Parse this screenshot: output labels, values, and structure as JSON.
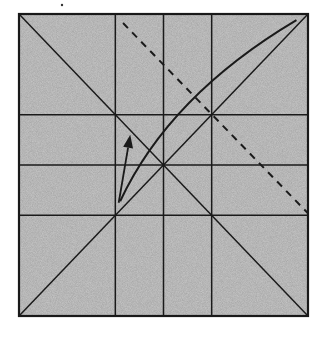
{
  "diagram": {
    "kind": "origami-crease-pattern",
    "paper_color": "#c8c8c8",
    "line_color": "#1a1a1a",
    "grid_divisions": 6,
    "crease_lines": [
      {
        "name": "diagonal-main",
        "from": [
          0,
          1
        ],
        "to": [
          1,
          0
        ],
        "style": "solid"
      },
      {
        "name": "diagonal-anti",
        "from": [
          0,
          0
        ],
        "to": [
          1,
          1
        ],
        "style": "solid"
      },
      {
        "name": "vertical-crease-1",
        "from": [
          0.3333,
          0
        ],
        "to": [
          0.3333,
          1
        ],
        "style": "solid"
      },
      {
        "name": "vertical-crease-2",
        "from": [
          0.5,
          0
        ],
        "to": [
          0.5,
          1
        ],
        "style": "solid"
      },
      {
        "name": "vertical-crease-3",
        "from": [
          0.6667,
          0
        ],
        "to": [
          0.6667,
          1
        ],
        "style": "solid"
      },
      {
        "name": "horizontal-crease-1",
        "from": [
          0,
          0.3333
        ],
        "to": [
          1,
          0.3333
        ],
        "style": "solid"
      },
      {
        "name": "horizontal-crease-2",
        "from": [
          0,
          0.5
        ],
        "to": [
          1,
          0.5
        ],
        "style": "solid"
      },
      {
        "name": "horizontal-crease-3",
        "from": [
          0,
          0.6667
        ],
        "to": [
          1,
          0.6667
        ],
        "style": "solid"
      }
    ],
    "valley_fold": {
      "name": "valley-fold-line",
      "from": [
        0.36,
        0.03
      ],
      "to": [
        1,
        0.66
      ],
      "style": "dashed"
    },
    "fold_curve": {
      "name": "fold-curve",
      "from": [
        0.35,
        0.62
      ],
      "control": [
        0.52,
        0.27
      ],
      "to": [
        0.96,
        0.02
      ]
    },
    "fold_arrow": {
      "name": "fold-direction-arrow",
      "from": [
        0.345,
        0.625
      ],
      "to": [
        0.385,
        0.4
      ]
    },
    "top_mark": {
      "name": "reference-dot",
      "position": [
        0.15,
        -0.03
      ]
    }
  }
}
